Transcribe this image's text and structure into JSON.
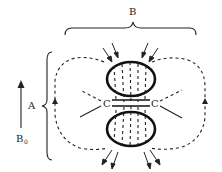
{
  "diagram": {
    "labels": {
      "width_brace": "B",
      "height_brace": "A",
      "field_arrow": "B",
      "field_arrow_subscript": "0",
      "cusp_left": "C",
      "cusp_right": "C"
    }
  }
}
